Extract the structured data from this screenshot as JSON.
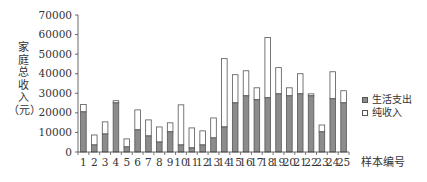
{
  "chart_data": {
    "type": "bar",
    "stacked": true,
    "title": "",
    "xlabel": "样本编号",
    "ylabel": "家庭总收入（元）",
    "ylim": [
      0,
      70000
    ],
    "yticks": [
      0,
      10000,
      20000,
      30000,
      40000,
      50000,
      60000,
      70000
    ],
    "grid": false,
    "legend_position": "right",
    "categories": [
      "1",
      "2",
      "3",
      "4",
      "5",
      "6",
      "7",
      "8",
      "9",
      "10",
      "11",
      "12",
      "13",
      "14",
      "15",
      "16",
      "17",
      "18",
      "19",
      "20",
      "21",
      "22",
      "23",
      "24",
      "25"
    ],
    "series": [
      {
        "name": "生活支出",
        "color": "#8c8c8c",
        "values": [
          20500,
          3600,
          9200,
          25100,
          2600,
          11300,
          8200,
          5100,
          10300,
          3600,
          2100,
          3600,
          7200,
          12800,
          25100,
          28700,
          26700,
          27700,
          29700,
          28700,
          29700,
          28700,
          10300,
          27200,
          25100
        ]
      },
      {
        "name": "纯收入",
        "color": "#ffffff",
        "values": [
          3800,
          5100,
          6200,
          1100,
          4100,
          10200,
          8200,
          7700,
          4600,
          20500,
          10200,
          7200,
          10200,
          34900,
          14400,
          12800,
          6100,
          30800,
          13400,
          4100,
          10300,
          1000,
          3500,
          13800,
          6200
        ]
      }
    ],
    "totals": [
      24300,
      8700,
      15400,
      26200,
      6700,
      21500,
      16400,
      12800,
      14900,
      24100,
      12300,
      10800,
      17400,
      47700,
      39500,
      41500,
      32800,
      58500,
      43100,
      32800,
      40000,
      29700,
      13800,
      41000,
      31300
    ]
  },
  "axis": {
    "y_label_chars": [
      "家",
      "庭",
      "总",
      "收",
      "入",
      "（元）"
    ],
    "x_title": "样本编号"
  },
  "legend": {
    "items": [
      {
        "label": "生活支出",
        "swatch": "#8c8c8c"
      },
      {
        "label": "纯收入",
        "swatch": "#ffffff"
      }
    ]
  }
}
